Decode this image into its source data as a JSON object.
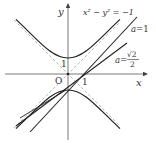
{
  "diagram": {
    "title": "",
    "axes": {
      "x_label": "x",
      "y_label": "y",
      "origin_label": "O",
      "x_tick_label": "1",
      "y_tick_label": "1"
    },
    "curve_label": "x² − y² = −1",
    "lines": [
      {
        "label_var": "a",
        "label_eq": "=",
        "label_value": "1"
      },
      {
        "label_var": "a",
        "label_eq": "=",
        "label_num": "√2",
        "label_den": "2"
      }
    ],
    "colors": {
      "curve": "#222222",
      "axis": "#555555",
      "asymptote": "#999999",
      "background": "#ffffff"
    }
  }
}
